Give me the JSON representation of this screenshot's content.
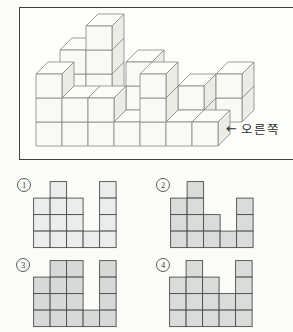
{
  "figure": {
    "view_label": "오른쪽",
    "arrow": "←",
    "cube_grid": {
      "cols": 7,
      "rows": 3,
      "stacks": [
        {
          "col": 0,
          "row": 2,
          "height": 3
        },
        {
          "col": 1,
          "row": 2,
          "height": 4
        },
        {
          "col": 3,
          "row": 1,
          "height": 3
        },
        {
          "col": 5,
          "row": 1,
          "height": 2
        },
        {
          "col": 6,
          "row": 2,
          "height": 2
        },
        {
          "col": 0,
          "row": 0,
          "height": 3
        },
        {
          "col": 1,
          "row": 0,
          "height": 2
        },
        {
          "col": 2,
          "row": 0,
          "height": 2
        },
        {
          "col": 3,
          "row": 0,
          "height": 1
        },
        {
          "col": 4,
          "row": 0,
          "height": 3
        },
        {
          "col": 5,
          "row": 0,
          "height": 1
        },
        {
          "col": 6,
          "row": 0,
          "height": 1
        }
      ]
    },
    "colors": {
      "face_front": "#f9f9f6",
      "face_top": "#fcfcfa",
      "face_right": "#ecece7",
      "edge": "#878781",
      "box_border": "#3f3f3d"
    }
  },
  "options": [
    {
      "number": "1",
      "pattern": [
        "01001",
        "11101",
        "11101",
        "11111"
      ],
      "fill": "#eaedec"
    },
    {
      "number": "2",
      "pattern": [
        "01000",
        "11001",
        "11101",
        "11111"
      ],
      "fill": "#d9dcda"
    },
    {
      "number": "3",
      "pattern": [
        "01101",
        "11101",
        "11101",
        "11111"
      ],
      "fill": "#d6d9d7"
    },
    {
      "number": "4",
      "pattern": [
        "01001",
        "11101",
        "11111",
        "11111"
      ],
      "fill": "#d9dcda"
    }
  ],
  "grid_style": {
    "stroke": "#4c4c4a"
  }
}
